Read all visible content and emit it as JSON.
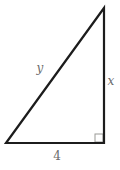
{
  "figure": {
    "type": "right-triangle-diagram",
    "labels": {
      "hypotenuse": "y",
      "vertical_leg": "x",
      "base": "4"
    },
    "right_angle_marker": "bottom-right-corner",
    "colors": {
      "edge_stroke": "#1c1c1c",
      "right_angle_stroke": "#9a9a96",
      "label_text": "#6b6b6b",
      "background": "#ffffff"
    }
  }
}
